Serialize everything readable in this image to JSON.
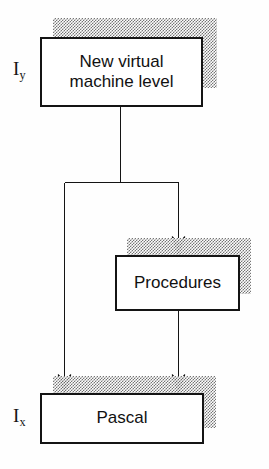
{
  "diagram": {
    "type": "flowchart",
    "background_color": "#fefefe",
    "line_color": "#141414",
    "box_border_color": "#141414",
    "box_fill_color": "#ffffff",
    "shadow_color": "#6e6e6e",
    "shadow_style": "dithered-halftone",
    "shadow_offset": {
      "x": 13,
      "y": -19
    },
    "nodes": [
      {
        "id": "vm",
        "label": "New virtual machine level",
        "line1": "New virtual",
        "line2": "machine level",
        "level_label": "I",
        "level_subscript": "y",
        "x": 40,
        "y": 37,
        "width": 163,
        "height": 70
      },
      {
        "id": "procedures",
        "label": "Procedures",
        "level_label": "",
        "level_subscript": "",
        "x": 115,
        "y": 255,
        "width": 125,
        "height": 56
      },
      {
        "id": "pascal",
        "label": "Pascal",
        "level_label": "I",
        "level_subscript": "x",
        "x": 40,
        "y": 393,
        "width": 164,
        "height": 51
      }
    ],
    "edges": [
      {
        "id": "vm-to-split",
        "from": "vm",
        "to": "split-bar",
        "arrow": false
      },
      {
        "id": "split-to-procedures",
        "from": "split-bar",
        "to": "procedures",
        "arrow": true
      },
      {
        "id": "split-to-pascal",
        "from": "split-bar",
        "to": "pascal",
        "arrow": true
      },
      {
        "id": "procedures-to-pascal",
        "from": "procedures",
        "to": "pascal",
        "arrow": true
      }
    ]
  }
}
